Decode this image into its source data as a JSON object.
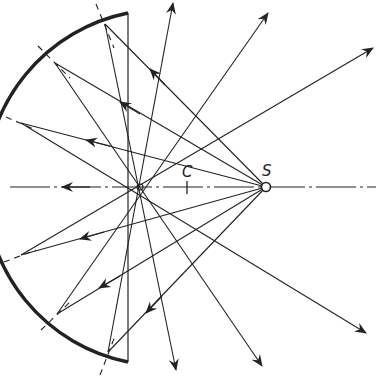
{
  "diagram": {
    "labels": {
      "center": "C",
      "source": "S"
    },
    "colors": {
      "ink": "#222222",
      "background": "#ffffff"
    },
    "mirror": {
      "center": [
        186,
        188
      ],
      "top_end": [
        128,
        13
      ],
      "bottom_end": [
        128,
        362
      ],
      "leftmost": [
        9,
        190
      ]
    },
    "source_point": [
      266,
      187
    ],
    "center_point": [
      187,
      187
    ],
    "focus_crossing": [
      140,
      187
    ],
    "reflection_points": [
      [
        105,
        24
      ],
      [
        55,
        63
      ],
      [
        21,
        123
      ],
      [
        21,
        255
      ],
      [
        57,
        314
      ],
      [
        108,
        352
      ]
    ],
    "reflected_ray_ends": [
      [
        176,
        370
      ],
      [
        262,
        366
      ],
      [
        366,
        333
      ],
      [
        373,
        48
      ],
      [
        268,
        13
      ],
      [
        173,
        3
      ]
    ]
  }
}
